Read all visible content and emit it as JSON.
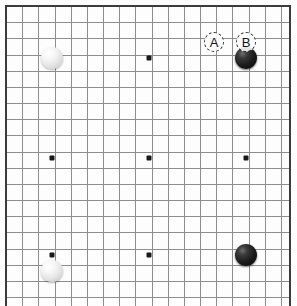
{
  "board": {
    "game": "Go",
    "size": 19,
    "origin_x": 6,
    "origin_y": 6,
    "cell": 16.17,
    "grid_color": "#8d8d8d",
    "edge_color": "#3b3b3b",
    "background_color": "#fdfdfd",
    "visible_columns": 18,
    "visible_rows": 18,
    "star_points": [
      {
        "name": "hoshi-top-middle",
        "x": 149,
        "y": 58
      },
      {
        "name": "hoshi-middle-left",
        "x": 52,
        "y": 158
      },
      {
        "name": "hoshi-center",
        "x": 149,
        "y": 158
      },
      {
        "name": "hoshi-middle-right",
        "x": 246,
        "y": 158
      },
      {
        "name": "hoshi-bottom-left",
        "x": 52,
        "y": 255
      },
      {
        "name": "hoshi-bottom-middle",
        "x": 149,
        "y": 255
      }
    ],
    "stones": [
      {
        "name": "stone-white-top-left",
        "color": "white",
        "color_hex": "#f2f2f2",
        "x": 52,
        "y": 58
      },
      {
        "name": "stone-black-top-right",
        "color": "black",
        "color_hex": "#1b1b1b",
        "x": 246,
        "y": 58
      },
      {
        "name": "stone-black-bottom-right",
        "color": "black",
        "color_hex": "#1b1b1b",
        "x": 246,
        "y": 255
      },
      {
        "name": "stone-white-bottom-left",
        "color": "white",
        "color_hex": "#f2f2f2",
        "x": 52,
        "y": 271
      }
    ],
    "markers": [
      {
        "name": "candidate-move-a",
        "label": "A",
        "x": 214,
        "y": 42
      },
      {
        "name": "candidate-move-b",
        "label": "B",
        "x": 246,
        "y": 42
      }
    ]
  }
}
